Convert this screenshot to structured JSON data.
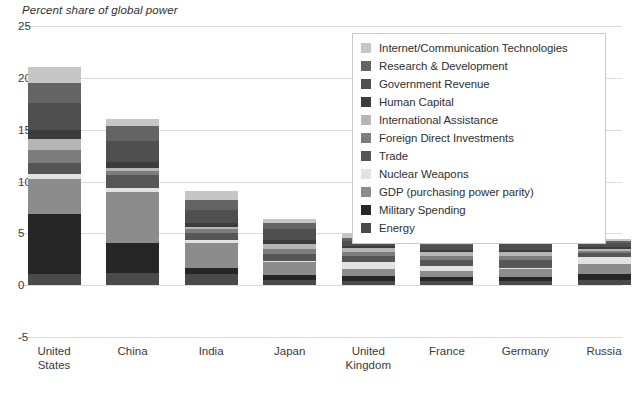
{
  "chart_data": {
    "type": "bar",
    "title": "Percent share of global power",
    "xlabel": "",
    "ylabel": "",
    "ylim": [
      -5,
      25
    ],
    "yticks": [
      25,
      20,
      15,
      10,
      5,
      0,
      -5
    ],
    "grid": true,
    "stacked": true,
    "legend_position": "top-right",
    "categories": [
      "United States",
      "China",
      "India",
      "Japan",
      "United Kingdom",
      "France",
      "Germany",
      "Russia"
    ],
    "category_lines": [
      [
        "United",
        "States"
      ],
      [
        "China"
      ],
      [
        "India"
      ],
      [
        "Japan"
      ],
      [
        "United",
        "Kingdom"
      ],
      [
        "France"
      ],
      [
        "Germany"
      ],
      [
        "Russia"
      ]
    ],
    "series": [
      {
        "name": "Energy",
        "color": "#4a4a4a",
        "values": [
          1.1,
          1.2,
          1.1,
          0.5,
          0.4,
          0.4,
          0.4,
          0.5
        ]
      },
      {
        "name": "Military Spending",
        "color": "#262626",
        "values": [
          5.8,
          2.9,
          0.6,
          0.5,
          0.5,
          0.4,
          0.4,
          0.6
        ]
      },
      {
        "name": "GDP (purchasing power parity)",
        "color": "#8c8c8c",
        "values": [
          3.3,
          4.9,
          2.4,
          1.2,
          0.7,
          0.6,
          0.8,
          0.9
        ]
      },
      {
        "name": "Nuclear Weapons",
        "color": "#e2e2e2",
        "values": [
          0.5,
          0.4,
          0.3,
          0.1,
          0.6,
          0.5,
          0.1,
          0.7
        ]
      },
      {
        "name": "Trade",
        "color": "#565656",
        "values": [
          1.1,
          1.2,
          0.6,
          0.7,
          0.6,
          0.5,
          0.7,
          0.4
        ]
      },
      {
        "name": "Foreign Direct Investments",
        "color": "#7d7d7d",
        "values": [
          1.2,
          0.4,
          0.4,
          0.5,
          0.4,
          0.4,
          0.4,
          0.2
        ]
      },
      {
        "name": "International Assistance",
        "color": "#b6b6b6",
        "values": [
          1.1,
          0.3,
          0.2,
          0.5,
          0.4,
          0.4,
          0.4,
          0.2
        ]
      },
      {
        "name": "Human Capital",
        "color": "#3c3c3c",
        "values": [
          0.9,
          0.6,
          0.4,
          0.4,
          0.2,
          0.2,
          0.2,
          0.2
        ]
      },
      {
        "name": "Government Revenue",
        "color": "#4f4f4f",
        "values": [
          2.6,
          2.0,
          1.3,
          1.0,
          0.5,
          0.5,
          0.6,
          0.4
        ]
      },
      {
        "name": "Research & Development",
        "color": "#646464",
        "values": [
          1.9,
          1.5,
          0.9,
          0.6,
          0.3,
          0.3,
          0.4,
          0.2
        ]
      },
      {
        "name": "Internet/Communication Technologies",
        "color": "#c6c6c6",
        "values": [
          1.6,
          0.6,
          0.9,
          0.4,
          0.4,
          0.3,
          0.3,
          0.2
        ]
      }
    ],
    "totals": [
      21.1,
      16.0,
      9.1,
      6.4,
      5.0,
      4.5,
      4.7,
      4.5
    ]
  },
  "legend": {
    "items": [
      {
        "label": "Internet/Communication Technologies",
        "color": "#c6c6c6"
      },
      {
        "label": "Research & Development",
        "color": "#646464"
      },
      {
        "label": "Government Revenue",
        "color": "#4f4f4f"
      },
      {
        "label": "Human Capital",
        "color": "#3c3c3c"
      },
      {
        "label": "International Assistance",
        "color": "#b6b6b6"
      },
      {
        "label": "Foreign Direct Investments",
        "color": "#7d7d7d"
      },
      {
        "label": "Trade",
        "color": "#565656"
      },
      {
        "label": "Nuclear Weapons",
        "color": "#e2e2e2"
      },
      {
        "label": "GDP (purchasing power parity)",
        "color": "#8c8c8c"
      },
      {
        "label": "Military Spending",
        "color": "#262626"
      },
      {
        "label": "Energy",
        "color": "#4a4a4a"
      }
    ]
  },
  "colors": {
    "background": "#ffffff",
    "gridline": "#dcdcdc",
    "frame_rule": "#b9b9b9",
    "text": "#333333",
    "legend_border": "#c9c9c9"
  }
}
